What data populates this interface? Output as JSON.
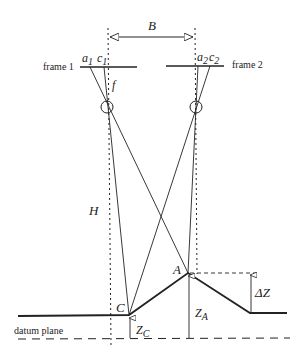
{
  "diagram": {
    "labels": {
      "baseline": "B",
      "frame1": "frame 1",
      "frame2": "frame 2",
      "a1": "a",
      "a1_sub": "1",
      "c1": "c",
      "c1_sub": "1",
      "a2": "a",
      "a2_sub": "2",
      "c2": "c",
      "c2_sub": "2",
      "focal": "f",
      "height": "H",
      "pointA": "A",
      "pointC": "C",
      "deltaZ": "ΔZ",
      "zA": "Z",
      "zA_sub": "A",
      "zC": "Z",
      "zC_sub": "C",
      "datum": "datum plane"
    },
    "colors": {
      "line": "#222222",
      "background": "#ffffff"
    }
  }
}
